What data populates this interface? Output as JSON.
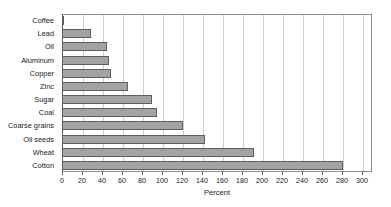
{
  "chart_data": {
    "type": "bar",
    "orientation": "horizontal",
    "title": "",
    "xlabel": "Percent",
    "ylabel": "",
    "categories": [
      "Coffee",
      "Lead",
      "Oil",
      "Aluminum",
      "Copper",
      "Zinc",
      "Sugar",
      "Coal",
      "Coarse grains",
      "Oil seeds",
      "Wheat",
      "Cotton"
    ],
    "values": [
      2,
      29,
      45,
      47,
      49,
      66,
      90,
      95,
      121,
      143,
      192,
      281
    ],
    "xlim": [
      0,
      310
    ],
    "xticks": [
      0,
      20,
      40,
      60,
      80,
      100,
      120,
      140,
      160,
      180,
      200,
      220,
      240,
      260,
      280,
      300
    ],
    "xtick_labels": [
      "0",
      "20",
      "40",
      "60",
      "80",
      "100",
      "120",
      "140",
      "160",
      "180",
      "200",
      "220",
      "240",
      "260",
      "280",
      "300"
    ],
    "grid": "vertical",
    "legend": null,
    "bar_color": "#a3a3a3",
    "bar_edge_color": "#5f5f5f",
    "gridline_color": "#cfcfcf",
    "axis_color": "#5a5a5a"
  },
  "clipped_header": {
    "text": ""
  }
}
